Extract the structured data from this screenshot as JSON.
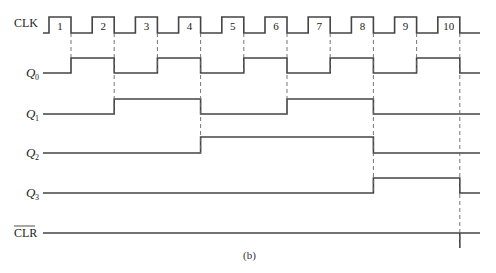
{
  "diagram": {
    "caption": "(b)",
    "colors": {
      "line": "#444444",
      "dash": "#666666",
      "text": "#222222"
    },
    "clock": {
      "label": "CLK",
      "pulse_numbers": [
        "1",
        "2",
        "3",
        "4",
        "5",
        "6",
        "7",
        "8",
        "9",
        "10"
      ]
    },
    "signals": [
      {
        "name": "Q",
        "subscript": "0",
        "transitions_on_falling_edges": [
          1,
          2,
          3,
          4,
          5,
          6,
          7,
          8,
          9,
          10
        ],
        "initial": 0
      },
      {
        "name": "Q",
        "subscript": "1",
        "transitions_on_falling_edges": [
          2,
          4,
          6,
          8
        ],
        "initial": 0
      },
      {
        "name": "Q",
        "subscript": "2",
        "transitions_on_falling_edges": [
          4,
          8
        ],
        "initial": 0
      },
      {
        "name": "Q",
        "subscript": "3",
        "transitions_on_falling_edges": [
          8,
          10
        ],
        "initial": 0
      }
    ],
    "clear": {
      "label": "CLR",
      "overbar": true,
      "pulse_at_falling_edge": 10
    }
  }
}
